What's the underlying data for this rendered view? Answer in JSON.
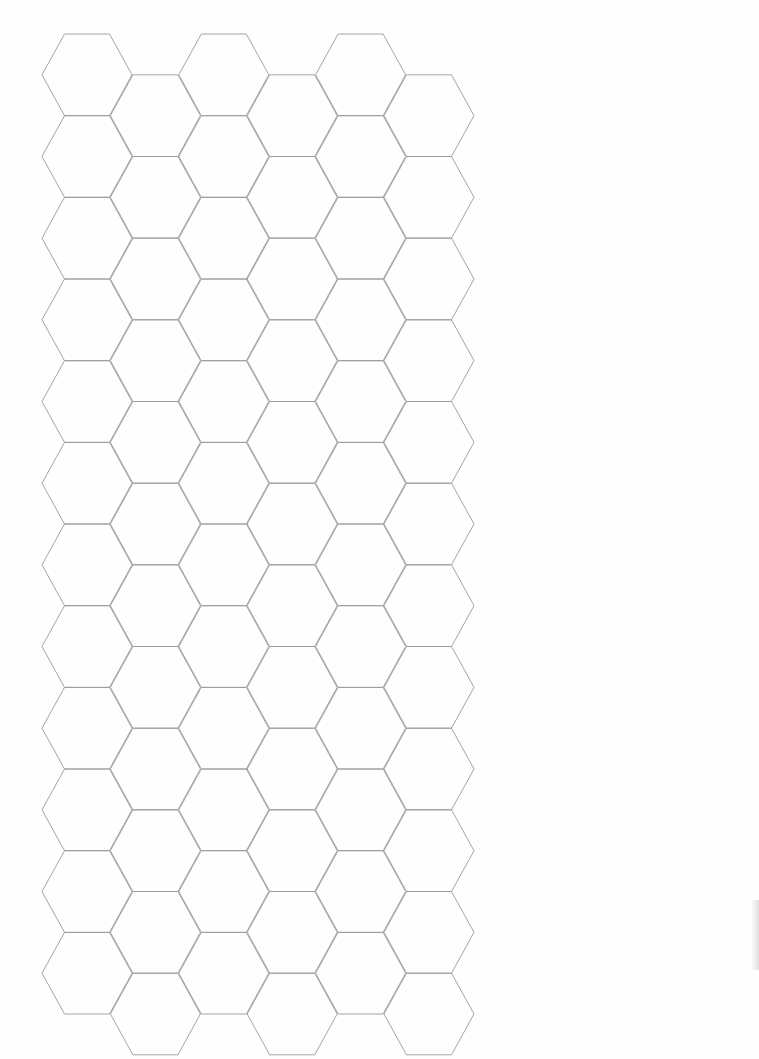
{
  "page": {
    "type": "hexagonal graph paper",
    "background": "#fefefe",
    "line_color": "#9a9a9a"
  },
  "grid": {
    "columns": 6,
    "rows_per_column": 12,
    "hex_width": 90,
    "hex_height": 81.67,
    "column_spacing": 68.4,
    "origin_left_vertex_x": 42,
    "origin_top_y": 34,
    "odd_column_offset_y": 40.8
  }
}
